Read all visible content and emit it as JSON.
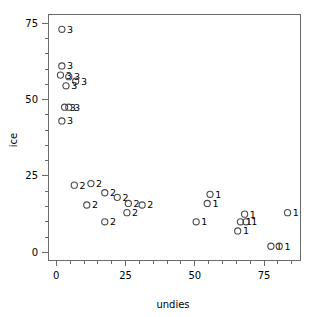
{
  "chart_data": {
    "type": "scatter",
    "title": "",
    "xlabel": "undies",
    "ylabel": "ice",
    "xlim": [
      -3,
      88
    ],
    "ylim": [
      -2.5,
      78
    ],
    "grid": false,
    "legend": null,
    "xticks": [
      0,
      25,
      50,
      75
    ],
    "xtick_labels": [
      "0",
      "25",
      "50",
      "75"
    ],
    "yticks": [
      0,
      25,
      50,
      75
    ],
    "ytick_labels": [
      "0",
      "25",
      "50",
      "75"
    ],
    "x_minor_ticks": [
      5,
      10,
      15,
      20,
      30,
      35,
      40,
      45,
      55,
      60,
      65,
      70,
      80,
      85
    ],
    "y_minor_ticks": [
      5,
      10,
      15,
      20,
      30,
      35,
      40,
      45,
      55,
      60,
      65,
      70
    ],
    "marker": "open-circle",
    "point_label_field": "label",
    "points": [
      {
        "x": 2.0,
        "y": 73.0,
        "label": "3"
      },
      {
        "x": 2.0,
        "y": 61.0,
        "label": "3"
      },
      {
        "x": 1.5,
        "y": 58.0,
        "label": "3"
      },
      {
        "x": 4.5,
        "y": 57.5,
        "label": "3"
      },
      {
        "x": 7.0,
        "y": 56.0,
        "label": "3"
      },
      {
        "x": 3.5,
        "y": 54.5,
        "label": "3"
      },
      {
        "x": 3.0,
        "y": 47.5,
        "label": "3"
      },
      {
        "x": 4.5,
        "y": 47.5,
        "label": "3"
      },
      {
        "x": 2.0,
        "y": 43.0,
        "label": "3"
      },
      {
        "x": 6.5,
        "y": 22.0,
        "label": "2"
      },
      {
        "x": 12.5,
        "y": 22.5,
        "label": "2"
      },
      {
        "x": 17.5,
        "y": 19.5,
        "label": "2"
      },
      {
        "x": 22.0,
        "y": 18.0,
        "label": "2"
      },
      {
        "x": 26.0,
        "y": 16.0,
        "label": "2"
      },
      {
        "x": 11.0,
        "y": 15.5,
        "label": "2"
      },
      {
        "x": 31.0,
        "y": 15.5,
        "label": "2"
      },
      {
        "x": 25.5,
        "y": 13.0,
        "label": "2"
      },
      {
        "x": 17.5,
        "y": 10.0,
        "label": "2"
      },
      {
        "x": 55.5,
        "y": 19.0,
        "label": "1"
      },
      {
        "x": 54.5,
        "y": 16.0,
        "label": "1"
      },
      {
        "x": 50.5,
        "y": 10.0,
        "label": "1"
      },
      {
        "x": 68.0,
        "y": 12.5,
        "label": "1"
      },
      {
        "x": 66.5,
        "y": 10.0,
        "label": "1"
      },
      {
        "x": 68.5,
        "y": 10.0,
        "label": "1"
      },
      {
        "x": 65.5,
        "y": 7.0,
        "label": "1"
      },
      {
        "x": 83.5,
        "y": 13.0,
        "label": "1"
      },
      {
        "x": 77.5,
        "y": 2.0,
        "label": "1"
      },
      {
        "x": 80.5,
        "y": 2.0,
        "label": "1"
      }
    ]
  },
  "colors": {
    "axis": "#6a6a6a",
    "marker": "#4a4a4a",
    "text": "#000000",
    "background": "#ffffff"
  }
}
